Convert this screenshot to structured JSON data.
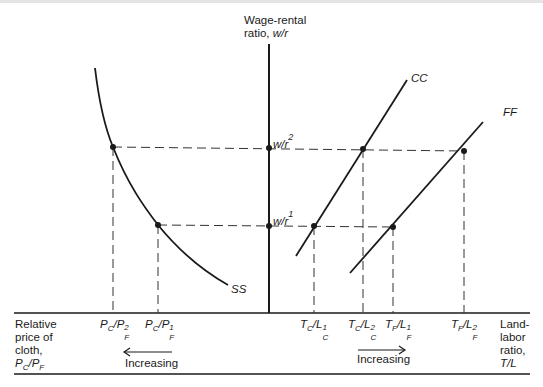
{
  "diagram": {
    "vertical_axis": {
      "label_line1": "Wage-rental",
      "label_line2_prefix": "ratio, ",
      "label_line2_var": "w/r"
    },
    "horizontal_left_label": {
      "line1": "Relative",
      "line2": "price of",
      "line3": "cloth,",
      "line4": "P_C/P_F"
    },
    "horizontal_right_label": {
      "line1": "Land-",
      "line2": "labor",
      "line3": "ratio,",
      "line4": "T/L"
    },
    "curves": {
      "ss": {
        "label": "SS"
      },
      "cc": {
        "label": "CC"
      },
      "ff": {
        "label": "FF"
      }
    },
    "wage_levels": {
      "w1": {
        "base": "w/r",
        "sup": "1"
      },
      "w2": {
        "base": "w/r",
        "sup": "2"
      }
    },
    "ticks_left": [
      {
        "base": "P",
        "sub1": "C",
        "mid": "/P",
        "sub2": "F",
        "sup": "2"
      },
      {
        "base": "P",
        "sub1": "C",
        "mid": "/P",
        "sub2": "F",
        "sup": "1"
      }
    ],
    "ticks_right": [
      {
        "base": "T",
        "sub1": "C",
        "mid": "/L",
        "sub2": "C",
        "sup": "1"
      },
      {
        "base": "T",
        "sub1": "C",
        "mid": "/L",
        "sub2": "C",
        "sup": "2"
      },
      {
        "base": "T",
        "sub1": "F",
        "mid": "/L",
        "sub2": "F",
        "sup": "1"
      },
      {
        "base": "T",
        "sub1": "F",
        "mid": "/L",
        "sub2": "F",
        "sup": "2"
      }
    ],
    "arrows": {
      "left": {
        "label": "Increasing",
        "direction": "left"
      },
      "right": {
        "label": "Increasing",
        "direction": "right"
      }
    },
    "colors": {
      "line": "#1a1a1a",
      "dash": "#333333"
    }
  }
}
